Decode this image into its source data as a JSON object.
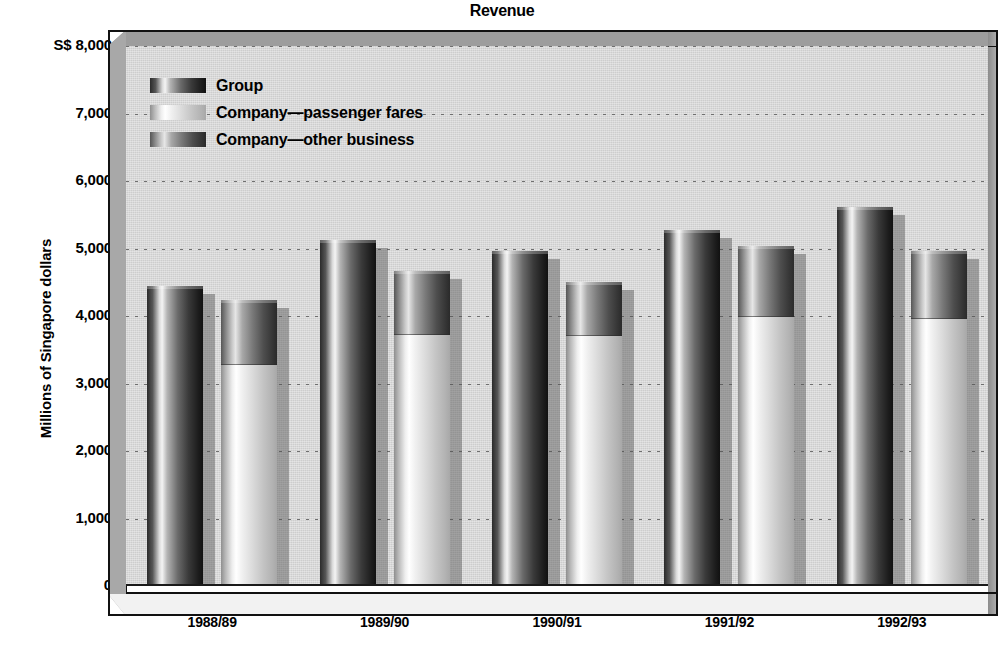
{
  "chart_data": {
    "type": "bar",
    "title": "Revenue",
    "xlabel": "",
    "ylabel": "Millions of Singapore dollars",
    "categories": [
      "1988/89",
      "1989/90",
      "1990/91",
      "1991/92",
      "1992/93"
    ],
    "ylim": [
      0,
      8000
    ],
    "ytick_labels": [
      "S$ 8,000",
      "7,000",
      "6,000",
      "5,000",
      "4,000",
      "3,000",
      "2,000",
      "1,000",
      "0"
    ],
    "ytick_values": [
      8000,
      7000,
      6000,
      5000,
      4000,
      3000,
      2000,
      1000,
      0
    ],
    "grid": true,
    "legend_position": "top-left",
    "series": [
      {
        "name": "Group",
        "values": [
          4440,
          5120,
          4960,
          5270,
          5610
        ]
      },
      {
        "name": "Company—passenger fares",
        "values": [
          3280,
          3720,
          3700,
          3980,
          3960
        ]
      },
      {
        "name": "Company—other business",
        "values": [
          960,
          950,
          810,
          1050,
          1000
        ]
      }
    ],
    "company_totals": [
      4240,
      4670,
      4510,
      5030,
      4960
    ],
    "stacked_series": [
      "Company—passenger fares",
      "Company—other business"
    ],
    "colors": {
      "group": "#3a3a3a",
      "passenger_fares": "#dcdcdc",
      "other_business": "#7a7a7a",
      "plot_background": "#cdcdcd",
      "frame": "#9d9d9d",
      "axis": "#111111",
      "gridline": "#6f6f6f"
    }
  },
  "legend": {
    "items": [
      {
        "label": "Group",
        "key": "group"
      },
      {
        "label": "Company—passenger fares",
        "key": "passenger_fares"
      },
      {
        "label": "Company—other business",
        "key": "other_business"
      }
    ]
  }
}
